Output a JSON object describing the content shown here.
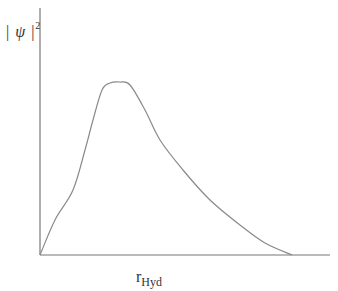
{
  "chart_data": {
    "type": "line",
    "title": "",
    "xlabel": "r_Hyd",
    "ylabel": "|ψ|²",
    "xlabel_main": "r",
    "xlabel_sub": "Hyd",
    "ylabel_bar_left": "|",
    "ylabel_symbol": "ψ",
    "ylabel_bar_right": "|",
    "ylabel_exp": "2",
    "grid": false,
    "legend": null,
    "ticks": "none",
    "series": [
      {
        "name": "|ψ|²",
        "color": "#8a8a8a",
        "points_px": [
          [
            40,
            255
          ],
          [
            55,
            220
          ],
          [
            73,
            190
          ],
          [
            85,
            150
          ],
          [
            93,
            120
          ],
          [
            102,
            90
          ],
          [
            110,
            83
          ],
          [
            120,
            82
          ],
          [
            130,
            85
          ],
          [
            145,
            110
          ],
          [
            160,
            140
          ],
          [
            183,
            170
          ],
          [
            210,
            200
          ],
          [
            240,
            225
          ],
          [
            265,
            243
          ],
          [
            292,
            255
          ]
        ]
      }
    ],
    "axes": {
      "origin_px": [
        40,
        255
      ],
      "x_end_px": [
        330,
        255
      ],
      "y_top_px": [
        40,
        8
      ]
    }
  }
}
